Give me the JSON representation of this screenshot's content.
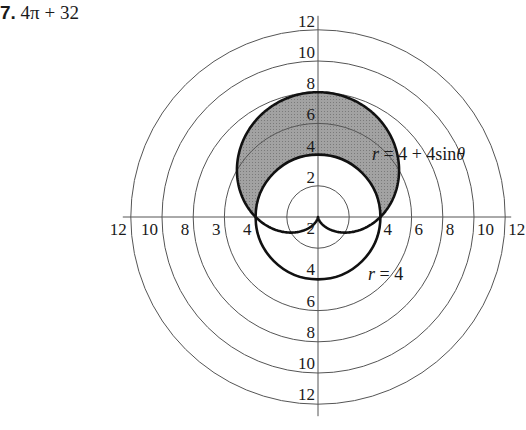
{
  "problem": {
    "number": "7.",
    "answer": "4π + 32"
  },
  "colors": {
    "grid": "#555555",
    "curve": "#111111",
    "shade": "#9a9a9a",
    "background": "#ffffff"
  },
  "chart_data": {
    "type": "polar",
    "title": "",
    "center_px": [
      318,
      217
    ],
    "px_per_unit": 15.6,
    "grid_circles": [
      2,
      4,
      6,
      8,
      10,
      12
    ],
    "axes": [
      "horizontal",
      "vertical"
    ],
    "curves": [
      {
        "name": "r = 4 + 4sinθ",
        "equation": "r = 4 + 4 sin(θ)",
        "type": "cardioid",
        "style": "thick"
      },
      {
        "name": "r = 4",
        "equation": "r = 4",
        "type": "circle",
        "style": "thick"
      }
    ],
    "shaded_region": "inside r = 4 + 4sinθ and outside r = 4",
    "shaded_area": "4π + 32",
    "tick_labels": {
      "vertical_up": [
        "2",
        "4",
        "6",
        "8",
        "10",
        "12"
      ],
      "vertical_down": [
        "2",
        "4",
        "6",
        "8",
        "10",
        "12"
      ],
      "horizontal_left": [
        "4",
        "3",
        "8",
        "10",
        "12"
      ],
      "horizontal_right": [
        "4",
        "6",
        "8",
        "10",
        "12"
      ]
    },
    "annotations": [
      "r = 4 + 4sinθ",
      "r = 4"
    ]
  },
  "labels": {
    "up": [
      {
        "text": "2",
        "r": 2
      },
      {
        "text": "4",
        "r": 4
      },
      {
        "text": "6",
        "r": 6
      },
      {
        "text": "8",
        "r": 8
      },
      {
        "text": "10",
        "r": 10
      },
      {
        "text": "12",
        "r": 12
      }
    ],
    "down": [
      {
        "text": "2",
        "r": 2
      },
      {
        "text": "4",
        "r": 4
      },
      {
        "text": "6",
        "r": 6
      },
      {
        "text": "8",
        "r": 8
      },
      {
        "text": "10",
        "r": 10
      },
      {
        "text": "12",
        "r": 12
      }
    ],
    "left": [
      {
        "text": "4",
        "r": 4
      },
      {
        "text": "3",
        "r": 6
      },
      {
        "text": "8",
        "r": 8
      },
      {
        "text": "10",
        "r": 10
      },
      {
        "text": "12",
        "r": 12
      }
    ],
    "right": [
      {
        "text": "4",
        "r": 4
      },
      {
        "text": "6",
        "r": 6
      },
      {
        "text": "8",
        "r": 8
      },
      {
        "text": "10",
        "r": 10
      },
      {
        "text": "12",
        "r": 12
      }
    ],
    "cardioid_label": "r = 4 + 4sinθ",
    "circle_label": "r = 4"
  }
}
